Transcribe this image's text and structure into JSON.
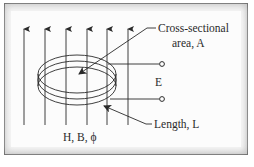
{
  "diagram": {
    "title": "",
    "labels": {
      "area_line1": "Cross-sectional",
      "area_line2": "area, A",
      "emf": "E",
      "length": "Length, L",
      "field": "H, B, ϕ"
    },
    "field_lines": {
      "count": 6,
      "direction": "up",
      "x_positions": [
        24,
        45,
        66,
        87,
        107,
        128
      ]
    },
    "coil": {
      "turns": 3,
      "terminals": 2
    },
    "colors": {
      "ink": "#2a2a2a",
      "frame_border": "#6f6f6f",
      "background": "#fcfcfc"
    }
  }
}
